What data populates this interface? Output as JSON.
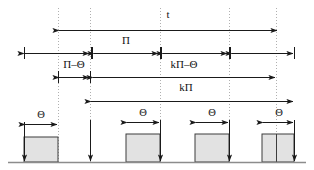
{
  "diagram": {
    "labels": {
      "t": "t",
      "pi": "Π",
      "pi_minus_theta": "Π–Θ",
      "k_pi_minus_theta": "kΠ–Θ",
      "k_pi": "kΠ",
      "theta_1": "Θ",
      "theta_2": "Θ",
      "theta_3": "Θ",
      "theta_4": "Θ"
    },
    "colors": {
      "line": "#1a1a1a",
      "pulse_fill": "#e2e2e2",
      "pulse_stroke": "#3d3d3d",
      "dotted": "#b0b0b0",
      "baseline": "#8c8c8c",
      "background": "#ffffff"
    },
    "guides": [
      {
        "name": "guide-a",
        "x": 58
      },
      {
        "name": "guide-b",
        "x": 90
      },
      {
        "name": "guide-c",
        "x": 160
      },
      {
        "name": "guide-d",
        "x": 229
      },
      {
        "name": "guide-e",
        "x": 276
      }
    ],
    "dimension_rows": [
      {
        "name": "t-row",
        "label": "t",
        "label_x": 168,
        "label_y": 18,
        "y": 30,
        "segments": [
          {
            "x1": 59,
            "x2": 277,
            "left_head": true,
            "right_head": true
          }
        ],
        "ticks": []
      },
      {
        "name": "pi-row",
        "label": "Π",
        "label_x": 126,
        "label_y": 44,
        "y": 53,
        "segments": [
          {
            "x1": 24,
            "x2": 89,
            "left_head": true,
            "right_head": true
          },
          {
            "x1": 94,
            "x2": 158,
            "left_head": true,
            "right_head": true
          },
          {
            "x1": 163,
            "x2": 227,
            "left_head": true,
            "right_head": true
          },
          {
            "x1": 232,
            "x2": 293,
            "left_head": true,
            "right_head": true
          }
        ],
        "ticks": [
          24,
          91,
          92,
          160,
          161,
          229,
          230,
          294
        ]
      },
      {
        "name": "pi-minus-theta-row",
        "label": "Π–Θ",
        "label_x": 74,
        "label_y": 68,
        "y": 77,
        "segments": [
          {
            "x1": 59,
            "x2": 89,
            "left_head": true,
            "right_head": true
          }
        ],
        "ticks": [
          58,
          90
        ]
      },
      {
        "name": "k-pi-minus-theta-row",
        "label": "kΠ–Θ",
        "label_x": 184,
        "label_y": 68,
        "y": 77,
        "segments": [
          {
            "x1": 93,
            "x2": 275,
            "left_head": true,
            "right_head": true
          }
        ],
        "ticks": []
      },
      {
        "name": "k-pi-row",
        "label": "kΠ",
        "label_x": 186,
        "label_y": 91,
        "y": 101,
        "segments": [
          {
            "x1": 91,
            "x2": 293,
            "left_head": true,
            "right_head": true
          }
        ],
        "ticks": []
      }
    ],
    "baseline_y": 162,
    "pulses": [
      {
        "name": "pulse-1",
        "x1": 24,
        "x2": 58,
        "top": 137,
        "split_x": null
      },
      {
        "name": "pulse-2",
        "x1": 126,
        "x2": 160,
        "top": 134,
        "split_x": null
      },
      {
        "name": "pulse-3",
        "x1": 195,
        "x2": 229,
        "top": 134,
        "split_x": null
      },
      {
        "name": "pulse-4",
        "x1": 262,
        "x2": 294,
        "top": 134,
        "split_x": 276
      }
    ],
    "theta_arrows": [
      {
        "name": "theta-arrow-1",
        "x1": 25,
        "x2": 57,
        "y": 124,
        "label_x": 41,
        "label_y": 118
      },
      {
        "name": "theta-arrow-2",
        "x1": 127,
        "x2": 159,
        "y": 122,
        "label_x": 143,
        "label_y": 116
      },
      {
        "name": "theta-arrow-3",
        "x1": 196,
        "x2": 228,
        "y": 122,
        "label_x": 212,
        "label_y": 116
      },
      {
        "name": "theta-arrow-4",
        "x1": 263,
        "x2": 293,
        "y": 122,
        "label_x": 279,
        "label_y": 116
      }
    ],
    "drop_arrows": [
      {
        "name": "drop-arrow-1",
        "x": 24,
        "y1": 122,
        "y2": 161
      },
      {
        "name": "drop-arrow-2",
        "x": 90,
        "y1": 120,
        "y2": 161
      },
      {
        "name": "drop-arrow-3",
        "x": 160,
        "y1": 120,
        "y2": 161
      },
      {
        "name": "drop-arrow-4",
        "x": 229,
        "y1": 120,
        "y2": 161
      },
      {
        "name": "drop-arrow-5",
        "x": 294,
        "y1": 120,
        "y2": 161
      }
    ]
  }
}
